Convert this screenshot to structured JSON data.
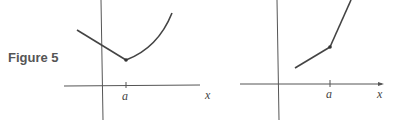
{
  "figure": {
    "caption": "Figure 5",
    "panels": [
      {
        "name": "left",
        "description": "Corner: linear piece decreasing to point at a, then curved piece increasing",
        "x_axis_label": "x",
        "tick_label": "a",
        "left_piece": "line",
        "right_piece": "curve"
      },
      {
        "name": "right",
        "description": "Corner: two linear pieces with different slopes meeting at a",
        "x_axis_label": "x",
        "tick_label": "a",
        "left_piece": "line",
        "right_piece": "line"
      }
    ]
  },
  "colors": {
    "axis": "#555555",
    "curve": "#444444",
    "caption": "#555555"
  }
}
